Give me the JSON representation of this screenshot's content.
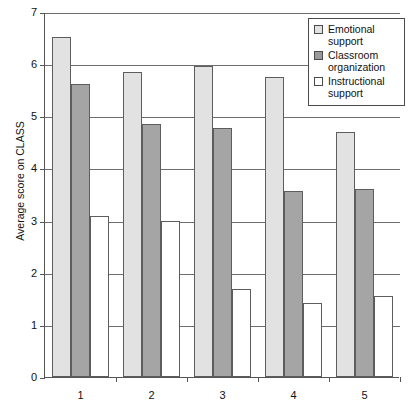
{
  "chart_data": {
    "type": "bar",
    "title": "",
    "xlabel": "",
    "ylabel": "Average score on CLASS",
    "categories": [
      "1",
      "2",
      "3",
      "4",
      "5"
    ],
    "ylim": [
      0,
      7
    ],
    "yticks": [
      "0",
      "1",
      "2",
      "3",
      "4",
      "5",
      "6",
      "7"
    ],
    "grid": true,
    "legend_position": "top-right",
    "series": [
      {
        "name": "Emotional support",
        "color": "#e2e2e2",
        "values": [
          6.52,
          5.85,
          5.97,
          5.75,
          4.7
        ]
      },
      {
        "name": "Classroom organization",
        "color": "#a5a5a5",
        "values": [
          5.62,
          4.86,
          4.78,
          3.56,
          3.61
        ]
      },
      {
        "name": "Instructional support",
        "color": "#ffffff",
        "values": [
          3.09,
          3.0,
          1.68,
          1.42,
          1.55
        ]
      }
    ]
  },
  "legend": {
    "items": [
      {
        "label_line1": "Emotional",
        "label_line2": "support",
        "swatch": "light-gray-swatch"
      },
      {
        "label_line1": "Classroom",
        "label_line2": "organization",
        "swatch": "dark-gray-swatch"
      },
      {
        "label_line1": "Instructional",
        "label_line2": "support",
        "swatch": "white-swatch"
      }
    ]
  }
}
